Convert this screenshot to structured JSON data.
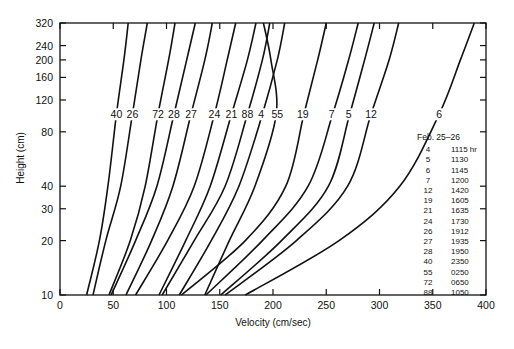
{
  "chart_data": {
    "type": "line",
    "title": "",
    "xlabel": "Velocity (cm/sec)",
    "ylabel": "Height (cm)",
    "xlim": [
      0,
      400
    ],
    "ylim": [
      10,
      320
    ],
    "yscale": "log",
    "x_ticks": [
      0,
      50,
      100,
      150,
      200,
      250,
      300,
      350,
      400
    ],
    "y_ticks": [
      10,
      20,
      30,
      40,
      80,
      120,
      160,
      200,
      240,
      320
    ],
    "grid": false,
    "legend_title": "Feb. 25–26",
    "heights": [
      10,
      20,
      40,
      100,
      200,
      320
    ],
    "series": [
      {
        "name": "40",
        "time": "2350",
        "values": [
          25,
          37,
          45,
          53,
          60,
          64
        ]
      },
      {
        "name": "26",
        "time": "1912",
        "values": [
          31,
          43,
          57,
          68,
          76,
          82
        ]
      },
      {
        "name": "72",
        "time": "0650",
        "values": [
          46,
          66,
          80,
          92,
          102,
          108
        ]
      },
      {
        "name": "28",
        "time": "1950",
        "values": [
          48,
          71,
          91,
          107,
          119,
          127
        ]
      },
      {
        "name": "27",
        "time": "1935",
        "values": [
          62,
          86,
          106,
          123,
          136,
          143
        ]
      },
      {
        "name": "24",
        "time": "1730",
        "values": [
          71,
          101,
          126,
          145,
          157,
          165
        ]
      },
      {
        "name": "21",
        "time": "1635",
        "values": [
          93,
          118,
          141,
          161,
          176,
          184
        ]
      },
      {
        "name": "88",
        "time": "1050",
        "values": [
          96,
          126,
          155,
          176,
          190,
          197
        ]
      },
      {
        "name": "4",
        "time": "1115",
        "values": [
          112,
          142,
          168,
          190,
          204,
          211
        ]
      },
      {
        "name": "55",
        "time": "0250",
        "values": [
          136,
          159,
          183,
          203,
          198,
          191
        ]
      },
      {
        "name": "19",
        "time": "1605",
        "values": [
          114,
          174,
          212,
          229,
          242,
          250
        ]
      },
      {
        "name": "7",
        "time": "1200",
        "values": [
          137,
          190,
          233,
          256,
          271,
          280
        ]
      },
      {
        "name": "5",
        "time": "1130",
        "values": [
          151,
          208,
          252,
          272,
          286,
          295
        ]
      },
      {
        "name": "12",
        "time": "1420",
        "values": [
          155,
          222,
          270,
          292,
          309,
          318
        ]
      },
      {
        "name": "6",
        "time": "1145",
        "values": [
          174,
          262,
          319,
          356,
          376,
          389
        ]
      }
    ],
    "curve_labels": [
      {
        "text": "40",
        "v": 53
      },
      {
        "text": "26",
        "v": 68
      },
      {
        "text": "72",
        "v": 92
      },
      {
        "text": "28",
        "v": 107
      },
      {
        "text": "27",
        "v": 123
      },
      {
        "text": "24",
        "v": 145
      },
      {
        "text": "21",
        "v": 161
      },
      {
        "text": "88",
        "v": 176
      },
      {
        "text": "4",
        "v": 189
      },
      {
        "text": "55",
        "v": 204
      },
      {
        "text": "19",
        "v": 228
      },
      {
        "text": "7",
        "v": 255
      },
      {
        "text": "5",
        "v": 271
      },
      {
        "text": "12",
        "v": 292
      },
      {
        "text": "6",
        "v": 356
      }
    ],
    "legend": [
      {
        "run": "4",
        "time": "1115 hr"
      },
      {
        "run": "5",
        "time": "1130"
      },
      {
        "run": "6",
        "time": "1145"
      },
      {
        "run": "7",
        "time": "1200"
      },
      {
        "run": "12",
        "time": "1420"
      },
      {
        "run": "19",
        "time": "1605"
      },
      {
        "run": "21",
        "time": "1635"
      },
      {
        "run": "24",
        "time": "1730"
      },
      {
        "run": "26",
        "time": "1912"
      },
      {
        "run": "27",
        "time": "1935"
      },
      {
        "run": "28",
        "time": "1950"
      },
      {
        "run": "40",
        "time": "2350"
      },
      {
        "run": "55",
        "time": "0250"
      },
      {
        "run": "72",
        "time": "0650"
      },
      {
        "run": "88",
        "time": "1050"
      }
    ]
  }
}
